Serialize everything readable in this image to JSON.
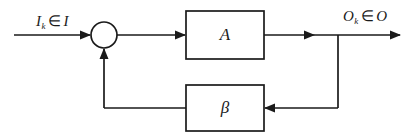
{
  "diagram": {
    "type": "feedback-control-block-diagram",
    "background_color": "#ffffff",
    "line_color": "#1a1a1a",
    "signals": {
      "input": {
        "symbol": "I",
        "subscript": "k",
        "element_of": "∈",
        "set": "I",
        "full_text": "Iₖ ∈ I"
      },
      "output": {
        "symbol": "O",
        "subscript": "k",
        "element_of": "∈",
        "set": "O",
        "full_text": "Oₖ ∈ O"
      }
    },
    "blocks": [
      {
        "id": "forward-block",
        "label": "A",
        "role": "forward-path-gain",
        "x": 186,
        "y": 11,
        "width": 78,
        "height": 48
      },
      {
        "id": "feedback-block",
        "label": "β",
        "role": "feedback-path-gain",
        "x": 186,
        "y": 85,
        "width": 78,
        "height": 46
      }
    ],
    "junction": {
      "id": "summing-junction",
      "label": "",
      "cx": 104,
      "cy": 35,
      "r": 13
    },
    "tap": {
      "id": "output-tap",
      "x": 338,
      "y": 35
    }
  }
}
